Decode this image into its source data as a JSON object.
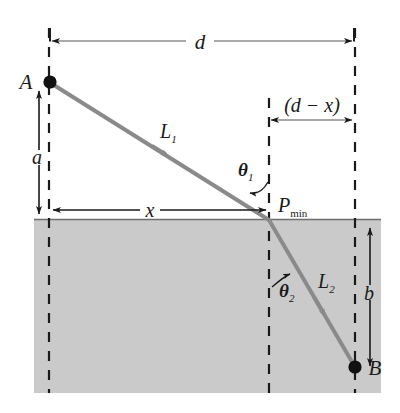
{
  "figure": {
    "colors": {
      "background": "#ffffff",
      "medium_fill": "#cacaca",
      "ray": "#8a8a8a",
      "ink": "#1a1a1a",
      "interface_line": "#6e6e6e"
    },
    "points": {
      "A": {
        "label": "A",
        "x": 49,
        "y": 82
      },
      "B": {
        "label": "B",
        "x": 355,
        "y": 367
      },
      "P": {
        "label": "P",
        "subscript": "min",
        "x": 269,
        "y": 220
      }
    },
    "segments": [
      {
        "name": "L1",
        "label": "L",
        "subscript": "1",
        "from": "A",
        "to": "P"
      },
      {
        "name": "L2",
        "label": "L",
        "subscript": "2",
        "from": "P",
        "to": "B"
      }
    ],
    "angles": [
      {
        "name": "theta1",
        "label": "θ",
        "subscript": "1"
      },
      {
        "name": "theta2",
        "label": "θ",
        "subscript": "2"
      }
    ],
    "dimensions": [
      {
        "name": "d",
        "label": "d",
        "orientation": "horizontal",
        "from_x": 50,
        "to_x": 353,
        "y": 41
      },
      {
        "name": "d-minus-x",
        "label": "(d − x)",
        "orientation": "horizontal",
        "from_x": 268,
        "to_x": 353,
        "y": 120
      },
      {
        "name": "x",
        "label": "x",
        "orientation": "horizontal",
        "from_x": 50,
        "to_x": 268,
        "y": 210
      },
      {
        "name": "a",
        "label": "a",
        "orientation": "vertical",
        "x": 39,
        "from_y": 90,
        "to_y": 214
      },
      {
        "name": "b",
        "label": "b",
        "orientation": "vertical",
        "x": 370,
        "from_y": 227,
        "to_y": 368
      }
    ],
    "medium": {
      "name": "lower-medium",
      "left": 34,
      "top": 219,
      "right": 381,
      "bottom": 393
    },
    "guides": [
      {
        "name": "vertical-guide-A",
        "x": 49
      },
      {
        "name": "vertical-guide-P",
        "x": 269
      },
      {
        "name": "vertical-guide-B",
        "x": 355
      }
    ]
  }
}
